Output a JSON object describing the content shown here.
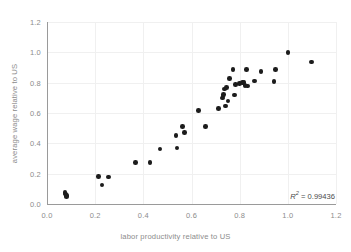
{
  "chart_data": {
    "type": "scatter",
    "title": "",
    "xlabel": "labor productivity relative to US",
    "ylabel": "average wage relative to US",
    "xlim": [
      0.0,
      1.2
    ],
    "ylim": [
      0.0,
      1.2
    ],
    "xticks": [
      "0.0",
      "0.2",
      "0.4",
      "0.6",
      "0.8",
      "1.0",
      "1.2"
    ],
    "yticks": [
      "0.0",
      "0.2",
      "0.4",
      "0.6",
      "0.8",
      "1.0",
      "1.2"
    ],
    "xtick_values": [
      0.0,
      0.2,
      0.4,
      0.6,
      0.8,
      1.0,
      1.2
    ],
    "ytick_values": [
      0.0,
      0.2,
      0.4,
      0.6,
      0.8,
      1.0,
      1.2
    ],
    "grid": true,
    "legend": "none",
    "marker_color": "#1c1c1c",
    "grid_color": "#f0f0f0",
    "axis_color": "#9a9a9a",
    "label_color": "#8c8c8c",
    "background_color": "#ffffff",
    "annotations": [
      {
        "name": "r-squared",
        "symbol": "R",
        "superscript": "2",
        "text": " = 0.99436",
        "value": 0.99436,
        "full_text": "R² = 0.99436",
        "position": "bottom-right-inside-plot"
      }
    ],
    "points": [
      [
        0.075,
        0.075
      ],
      [
        0.078,
        0.065
      ],
      [
        0.08,
        0.055
      ],
      [
        0.082,
        0.05
      ],
      [
        0.215,
        0.18
      ],
      [
        0.228,
        0.125
      ],
      [
        0.255,
        0.178
      ],
      [
        0.368,
        0.275
      ],
      [
        0.428,
        0.272
      ],
      [
        0.47,
        0.362
      ],
      [
        0.535,
        0.452
      ],
      [
        0.54,
        0.368
      ],
      [
        0.562,
        0.51
      ],
      [
        0.57,
        0.47
      ],
      [
        0.628,
        0.618
      ],
      [
        0.658,
        0.512
      ],
      [
        0.712,
        0.628
      ],
      [
        0.728,
        0.7
      ],
      [
        0.73,
        0.712
      ],
      [
        0.732,
        0.722
      ],
      [
        0.738,
        0.758
      ],
      [
        0.742,
        0.645
      ],
      [
        0.745,
        0.77
      ],
      [
        0.752,
        0.68
      ],
      [
        0.758,
        0.828
      ],
      [
        0.772,
        0.885
      ],
      [
        0.778,
        0.718
      ],
      [
        0.782,
        0.788
      ],
      [
        0.8,
        0.795
      ],
      [
        0.812,
        0.8
      ],
      [
        0.818,
        0.8
      ],
      [
        0.822,
        0.782
      ],
      [
        0.828,
        0.885
      ],
      [
        0.832,
        0.778
      ],
      [
        0.862,
        0.812
      ],
      [
        0.888,
        0.872
      ],
      [
        0.942,
        0.808
      ],
      [
        0.948,
        0.885
      ],
      [
        1.0,
        1.0
      ],
      [
        1.098,
        0.935
      ]
    ]
  }
}
